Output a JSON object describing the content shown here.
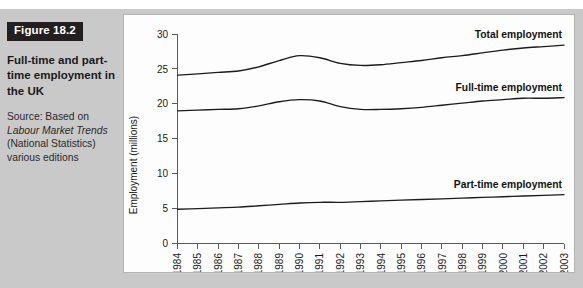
{
  "figure": {
    "badge": "Figure 18.2",
    "title": "Full-time and part-time employment in the UK",
    "source_line1": "Source: Based on",
    "source_italic": "Labour Market Trends",
    "source_line2": "(National Statistics)",
    "source_line3": "various editions"
  },
  "colors": {
    "page_background": "#c9c9c9",
    "panel_background": "#fdfdfd",
    "badge_background": "#231f20",
    "badge_text": "#ffffff",
    "line": "#1c1c1c",
    "axis": "#5a5a5a"
  },
  "chart_data": {
    "type": "line",
    "title": "",
    "xlabel": "",
    "ylabel": "Employment (millions)",
    "ylim": [
      0,
      30
    ],
    "yticks": [
      0,
      5,
      10,
      15,
      20,
      25,
      30
    ],
    "grid": false,
    "legend_position": "inline-right",
    "categories": [
      "1984",
      "1985",
      "1986",
      "1987",
      "1988",
      "1989",
      "1990",
      "1991",
      "1992",
      "1993",
      "1994",
      "1995",
      "1996",
      "1997",
      "1998",
      "1999",
      "2000",
      "2001",
      "2002",
      "2003"
    ],
    "x": [
      1984,
      1985,
      1986,
      1987,
      1988,
      1989,
      1990,
      1991,
      1992,
      1993,
      1994,
      1995,
      1996,
      1997,
      1998,
      1999,
      2000,
      2001,
      2002,
      2003
    ],
    "series": [
      {
        "name": "Total employment",
        "label": "Total employment",
        "values": [
          24.1,
          24.3,
          24.5,
          24.7,
          25.3,
          26.2,
          26.9,
          26.6,
          25.8,
          25.5,
          25.6,
          25.9,
          26.2,
          26.6,
          26.9,
          27.3,
          27.7,
          28.0,
          28.2,
          28.4
        ]
      },
      {
        "name": "Full-time employment",
        "label": "Full-time employment",
        "values": [
          19.0,
          19.1,
          19.2,
          19.3,
          19.7,
          20.3,
          20.6,
          20.4,
          19.6,
          19.2,
          19.2,
          19.3,
          19.5,
          19.8,
          20.1,
          20.4,
          20.6,
          20.8,
          20.8,
          20.9
        ]
      },
      {
        "name": "Part-time employment",
        "label": "Part-time employment",
        "values": [
          4.9,
          5.0,
          5.1,
          5.2,
          5.4,
          5.6,
          5.8,
          5.9,
          5.9,
          6.0,
          6.1,
          6.2,
          6.3,
          6.4,
          6.5,
          6.6,
          6.7,
          6.8,
          6.9,
          7.0
        ]
      }
    ]
  }
}
